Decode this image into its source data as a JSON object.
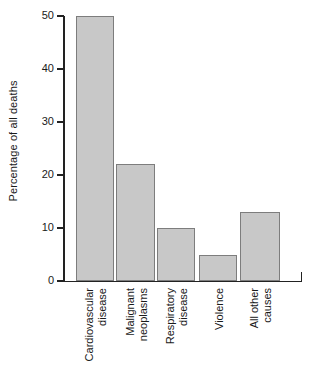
{
  "chart_data": {
    "type": "bar",
    "title": "",
    "xlabel": "",
    "ylabel": "Percentage of all deaths",
    "categories": [
      "Cardiovascular disease",
      "Malignant neoplasms",
      "Respiratory disease",
      "Violence",
      "All other causes"
    ],
    "category_lines": [
      [
        "Cardiovascular",
        "disease"
      ],
      [
        "Malignant",
        "neoplasms"
      ],
      [
        "Respiratory",
        "disease"
      ],
      [
        "Violence"
      ],
      [
        "All other",
        "causes"
      ]
    ],
    "values": [
      50,
      22,
      10,
      5,
      13
    ],
    "ylim": [
      0,
      50
    ],
    "yticks": [
      0,
      10,
      20,
      30,
      40,
      50
    ],
    "ytick_labels": [
      "0",
      "10",
      "20",
      "30",
      "40",
      "50"
    ],
    "grid": false,
    "legend": false,
    "bar_fill_color": "#c8c8c8",
    "bar_border_color": "#7d7d7d",
    "axis_color": "#222222",
    "background_color": "#ffffff"
  }
}
